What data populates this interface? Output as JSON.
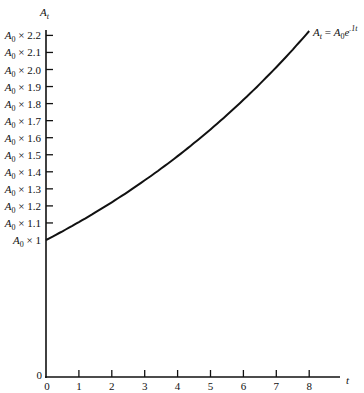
{
  "chart_data": {
    "type": "line",
    "title": "",
    "xlabel": "t",
    "ylabel": "A_t",
    "x_ticks": [
      "0",
      "1",
      "2",
      "3",
      "4",
      "5",
      "6",
      "7",
      "8"
    ],
    "y_ticks": [
      "A0 × 1",
      "A0 × 1.1",
      "A0 × 1.2",
      "A0 × 1.3",
      "A0 × 1.4",
      "A0 × 1.5",
      "A0 × 1.6",
      "A0 × 1.7",
      "A0 × 1.8",
      "A0 × 1.9",
      "A0 × 2.0",
      "A0 × 2.1",
      "A0 × 2.2"
    ],
    "y_origin_label": "0",
    "xlim": [
      0,
      8.9
    ],
    "ylim": [
      0,
      2.3
    ],
    "y_axis_break": "linear from 0 to A0×1 compressed; ticks at 0.1 multiples of A0 from 1 to 2.2",
    "series": [
      {
        "name": "A_t = A_0 e^{.1t}",
        "x": [
          0,
          1,
          2,
          3,
          4,
          5,
          6,
          7,
          8
        ],
        "values": [
          1.0,
          1.105,
          1.221,
          1.35,
          1.492,
          1.649,
          1.822,
          2.014,
          2.226
        ]
      }
    ],
    "annotations": [
      {
        "text": "A_t = A_0 e^{.1t}",
        "position": "end of curve, upper right"
      }
    ],
    "grid": false,
    "legend": "none"
  },
  "labels": {
    "y_axis": {
      "base": "A",
      "sub": "t"
    },
    "x_axis": "t",
    "origin_y": "0",
    "curve": {
      "lhs_base": "A",
      "lhs_sub": "t",
      "eq": " = ",
      "rhs_base": "A",
      "rhs_sub": "0",
      "e": "e",
      "exp": ".1t"
    }
  }
}
